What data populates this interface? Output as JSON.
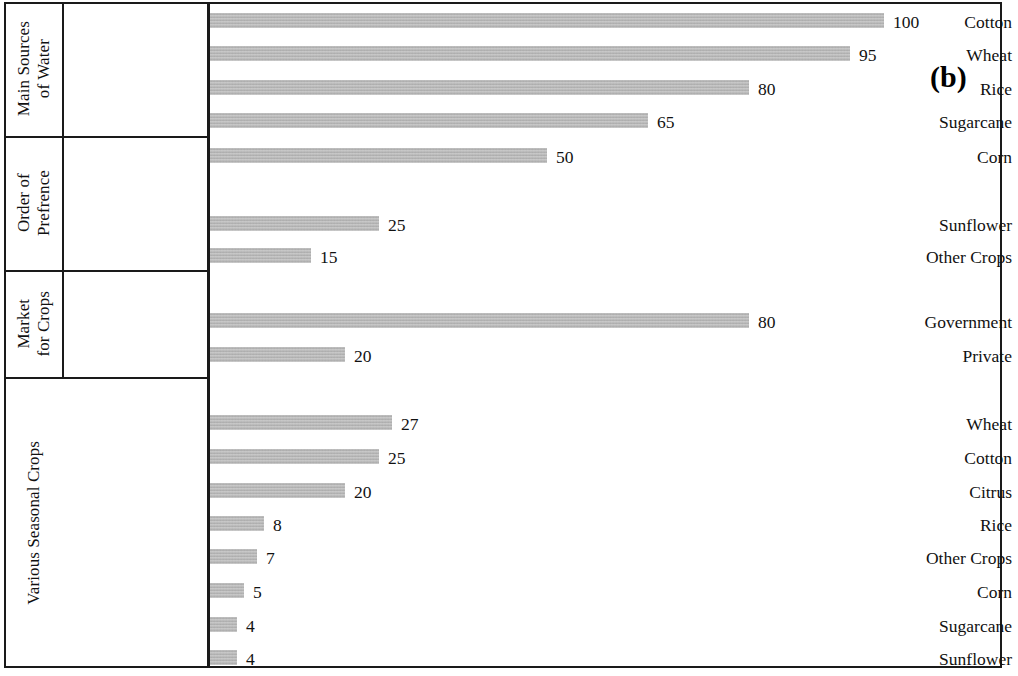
{
  "figure": {
    "panel_tag": "(b)",
    "panel_tag_x": 930,
    "panel_tag_y": 62,
    "bar_color": "#b3b3b3",
    "axis_color": "#1a1a1a",
    "text_color": "#111111"
  },
  "chart_data": {
    "type": "bar",
    "orientation": "horizontal",
    "title": "",
    "subtitle": "",
    "xlabel": "",
    "ylabel": "",
    "xlim": [
      0,
      100
    ],
    "grid": false,
    "legend": false,
    "value_labels": true,
    "panel_label": "(b)",
    "px_per_unit": 6.74,
    "groups": [
      {
        "name": "Main Sources\nof Water",
        "name_lines": [
          "Main Sources",
          "of Water"
        ],
        "top": 2,
        "bottom": 136,
        "categories": [
          "Cotton",
          "Wheat",
          "Rice",
          "Sugarcane"
        ],
        "values": [
          100,
          95,
          80,
          65
        ],
        "bar_tops": [
          13,
          46,
          80,
          113
        ]
      },
      {
        "name": "Order of\nPrefrence",
        "name_lines": [
          "Order of",
          "Prefrence"
        ],
        "top": 136,
        "bottom": 270,
        "categories": [
          "Corn",
          "Sunflower",
          "Other Crops"
        ],
        "values": [
          50,
          25,
          15
        ],
        "bar_tops": [
          148,
          216,
          248
        ]
      },
      {
        "name": "Market\nfor Crops",
        "name_lines": [
          "Market",
          "for Crops"
        ],
        "top": 270,
        "bottom": 377,
        "categories": [
          "Government",
          "Private"
        ],
        "values": [
          80,
          20
        ],
        "bar_tops": [
          313,
          347
        ]
      },
      {
        "name": "Various Seasonal Crops",
        "name_lines": [
          "Various Seasonal Crops"
        ],
        "top": 377,
        "bottom": 668,
        "categories": [
          "Wheat",
          "Cotton",
          "Citrus",
          "Rice",
          "Other Crops",
          "Corn",
          "Sugarcane",
          "Sunflower"
        ],
        "values": [
          27,
          25,
          20,
          8,
          7,
          5,
          4,
          4
        ],
        "bar_tops": [
          415,
          449,
          483,
          516,
          549,
          583,
          617,
          650
        ]
      }
    ],
    "all_categories": [
      "Cotton",
      "Wheat",
      "Rice",
      "Sugarcane",
      "Corn",
      "Sunflower",
      "Other Crops",
      "Government",
      "Private",
      "Wheat",
      "Cotton",
      "Citrus",
      "Rice",
      "Other Crops",
      "Corn",
      "Sugarcane",
      "Sunflower"
    ],
    "all_values": [
      100,
      95,
      80,
      65,
      50,
      25,
      15,
      80,
      20,
      27,
      25,
      20,
      8,
      7,
      5,
      4,
      4
    ]
  }
}
